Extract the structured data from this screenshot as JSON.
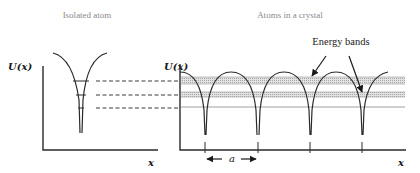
{
  "left_panel": {
    "title": "Isolated atom",
    "y_label": "U(x)",
    "x_label": "x",
    "energy_levels": 3
  },
  "right_panel": {
    "title": "Atoms in a crystal",
    "y_label": "U(x)",
    "x_label": "x",
    "annotation": "Energy bands",
    "spacing_label": "a",
    "atom_count": 4,
    "band_count": 3
  },
  "colors": {
    "line": "#2a2a2a",
    "title": "#8a8a8a",
    "band": "#c8c8c8"
  }
}
